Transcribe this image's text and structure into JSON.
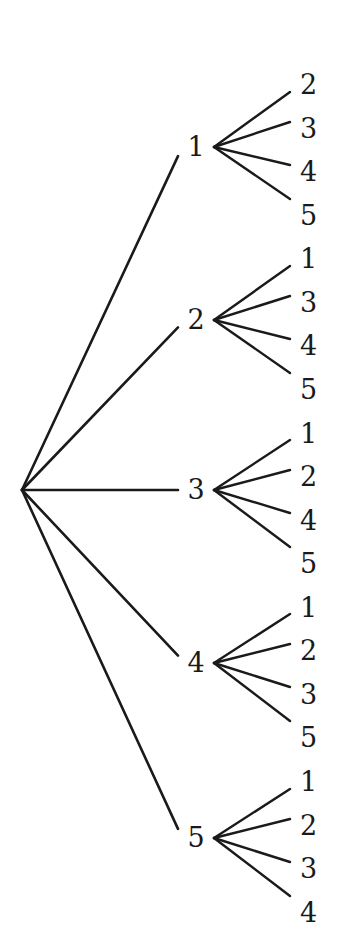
{
  "figure": {
    "name": "permutation-tree",
    "background_color": "#ffffff",
    "stroke_color": "#1a1a1a",
    "text_color": "#1a1a1a",
    "width": 347,
    "height": 951
  },
  "tree": {
    "root": {
      "label": "",
      "x": 22,
      "y": 490
    },
    "level1": [
      {
        "label": "1",
        "label_x": 196,
        "label_y": 147,
        "vertex_x": 214,
        "vertex_y": 147,
        "children": [
          {
            "label": "2",
            "label_x": 300,
            "label_y": 85,
            "edge_end_x": 290,
            "edge_end_y": 92
          },
          {
            "label": "3",
            "label_x": 300,
            "label_y": 129,
            "edge_end_x": 290,
            "edge_end_y": 122
          },
          {
            "label": "4",
            "label_x": 300,
            "label_y": 172,
            "edge_end_x": 290,
            "edge_end_y": 165
          },
          {
            "label": "5",
            "label_x": 300,
            "label_y": 216,
            "edge_end_x": 290,
            "edge_end_y": 199
          }
        ]
      },
      {
        "label": "2",
        "label_x": 196,
        "label_y": 320,
        "vertex_x": 214,
        "vertex_y": 320,
        "children": [
          {
            "label": "1",
            "label_x": 300,
            "label_y": 259,
            "edge_end_x": 290,
            "edge_end_y": 266
          },
          {
            "label": "3",
            "label_x": 300,
            "label_y": 303,
            "edge_end_x": 290,
            "edge_end_y": 296
          },
          {
            "label": "4",
            "label_x": 300,
            "label_y": 346,
            "edge_end_x": 290,
            "edge_end_y": 339
          },
          {
            "label": "5",
            "label_x": 300,
            "label_y": 390,
            "edge_end_x": 290,
            "edge_end_y": 373
          }
        ]
      },
      {
        "label": "3",
        "label_x": 196,
        "label_y": 490,
        "vertex_x": 214,
        "vertex_y": 490,
        "children": [
          {
            "label": "1",
            "label_x": 300,
            "label_y": 434,
            "edge_end_x": 290,
            "edge_end_y": 440
          },
          {
            "label": "2",
            "label_x": 300,
            "label_y": 477,
            "edge_end_x": 290,
            "edge_end_y": 470
          },
          {
            "label": "4",
            "label_x": 300,
            "label_y": 521,
            "edge_end_x": 290,
            "edge_end_y": 513
          },
          {
            "label": "5",
            "label_x": 300,
            "label_y": 564,
            "edge_end_x": 290,
            "edge_end_y": 547
          }
        ]
      },
      {
        "label": "4",
        "label_x": 196,
        "label_y": 663,
        "vertex_x": 214,
        "vertex_y": 663,
        "children": [
          {
            "label": "1",
            "label_x": 300,
            "label_y": 608,
            "edge_end_x": 290,
            "edge_end_y": 614
          },
          {
            "label": "2",
            "label_x": 300,
            "label_y": 651,
            "edge_end_x": 290,
            "edge_end_y": 644
          },
          {
            "label": "3",
            "label_x": 300,
            "label_y": 695,
            "edge_end_x": 290,
            "edge_end_y": 687
          },
          {
            "label": "5",
            "label_x": 300,
            "label_y": 738,
            "edge_end_x": 290,
            "edge_end_y": 721
          }
        ]
      },
      {
        "label": "5",
        "label_x": 196,
        "label_y": 838,
        "vertex_x": 214,
        "vertex_y": 838,
        "children": [
          {
            "label": "1",
            "label_x": 300,
            "label_y": 782,
            "edge_end_x": 290,
            "edge_end_y": 789
          },
          {
            "label": "2",
            "label_x": 300,
            "label_y": 826,
            "edge_end_x": 290,
            "edge_end_y": 819
          },
          {
            "label": "3",
            "label_x": 300,
            "label_y": 869,
            "edge_end_x": 290,
            "edge_end_y": 862
          },
          {
            "label": "4",
            "label_x": 300,
            "label_y": 913,
            "edge_end_x": 290,
            "edge_end_y": 896
          }
        ]
      }
    ],
    "root_edge_end_x": 178
  },
  "chart_data": {
    "type": "diagram",
    "title": "",
    "root_children": [
      "1",
      "2",
      "3",
      "4",
      "5"
    ],
    "branches": [
      {
        "node": "1",
        "leaves": [
          "2",
          "3",
          "4",
          "5"
        ]
      },
      {
        "node": "2",
        "leaves": [
          "1",
          "3",
          "4",
          "5"
        ]
      },
      {
        "node": "3",
        "leaves": [
          "1",
          "2",
          "4",
          "5"
        ]
      },
      {
        "node": "4",
        "leaves": [
          "1",
          "2",
          "3",
          "5"
        ]
      },
      {
        "node": "5",
        "leaves": [
          "1",
          "2",
          "3",
          "4"
        ]
      }
    ],
    "leaf_sequence": [
      "2",
      "3",
      "4",
      "5",
      "1",
      "3",
      "4",
      "5",
      "1",
      "2",
      "4",
      "5",
      "1",
      "2",
      "3",
      "5",
      "1",
      "2",
      "3",
      "4"
    ],
    "total_leaves": 20,
    "total_level1_nodes": 5
  }
}
